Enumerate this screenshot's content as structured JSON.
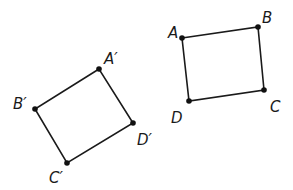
{
  "figures": [
    {
      "name": "quadrilateral-ABCD",
      "points": [
        {
          "label": "A",
          "x": 182,
          "y": 38,
          "lx": 168,
          "ly": 38
        },
        {
          "label": "B",
          "x": 258,
          "y": 27,
          "lx": 262,
          "ly": 23
        },
        {
          "label": "C",
          "x": 264,
          "y": 90,
          "lx": 270,
          "ly": 112
        },
        {
          "label": "D",
          "x": 189,
          "y": 101,
          "lx": 171,
          "ly": 123
        }
      ]
    },
    {
      "name": "quadrilateral-A-prime-B-prime-C-prime-D-prime",
      "points": [
        {
          "label": "A′",
          "x": 99,
          "y": 69,
          "lx": 104,
          "ly": 64
        },
        {
          "label": "B′",
          "x": 35,
          "y": 109,
          "lx": 13,
          "ly": 109
        },
        {
          "label": "C′",
          "x": 67,
          "y": 163,
          "lx": 49,
          "ly": 183
        },
        {
          "label": "D′",
          "x": 133,
          "y": 123,
          "lx": 137,
          "ly": 145
        }
      ]
    }
  ],
  "colors": {
    "stroke": "#1a1a1a",
    "background": "#ffffff"
  }
}
